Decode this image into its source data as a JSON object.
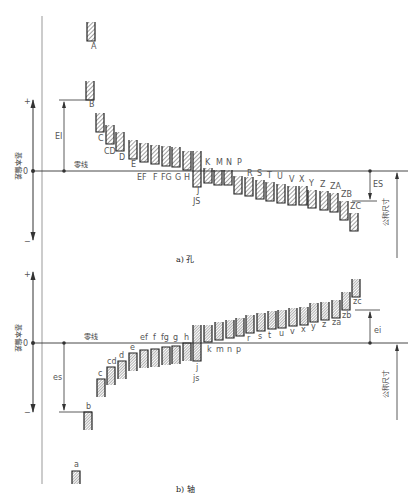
{
  "diagram": {
    "title_hole": "a) 孔",
    "title_shaft": "b) 轴",
    "axis_label": "基本偏差",
    "nominal_size_label": "公称尺寸",
    "zero_line_label": "零线",
    "zero_mark": "0",
    "plus_mark": "+",
    "minus_mark": "−",
    "hole_upper_label": "EI",
    "hole_lower_label": "ES",
    "shaft_upper_label": "es",
    "shaft_lower_label": "ei",
    "colors": {
      "line": "#333333",
      "hatch": "#444444",
      "text": "#555555"
    }
  },
  "hole": {
    "zero_y": 171,
    "boxes": [
      {
        "label": "A",
        "x": 87,
        "y1": 22,
        "y2": 41,
        "lx": 91,
        "ly": 49
      },
      {
        "label": "B",
        "x": 86,
        "y1": 81,
        "y2": 100,
        "lx": 89,
        "ly": 107
      },
      {
        "label": "C",
        "x": 96,
        "y1": 113,
        "y2": 132,
        "lx": 98,
        "ly": 141
      },
      {
        "label": "CD",
        "x": 106,
        "y1": 125,
        "y2": 144,
        "lx": 104,
        "ly": 154
      },
      {
        "label": "D",
        "x": 116,
        "y1": 132,
        "y2": 151,
        "lx": 119,
        "ly": 160
      },
      {
        "label": "E",
        "x": 129,
        "y1": 140,
        "y2": 159,
        "lx": 131,
        "ly": 167
      },
      {
        "label": "EF",
        "x": 140,
        "y1": 143,
        "y2": 162,
        "lx": 137,
        "ly": 180
      },
      {
        "label": "F",
        "x": 151,
        "y1": 145,
        "y2": 164,
        "lx": 153,
        "ly": 180
      },
      {
        "label": "FG",
        "x": 162,
        "y1": 146,
        "y2": 166,
        "lx": 161,
        "ly": 180
      },
      {
        "label": "G",
        "x": 172,
        "y1": 147,
        "y2": 167,
        "lx": 175,
        "ly": 180
      },
      {
        "label": "H",
        "x": 183,
        "y1": 151,
        "y2": 170,
        "lx": 184,
        "ly": 180
      },
      {
        "label": "J",
        "x": 193,
        "y1": 151,
        "y2": 187,
        "lx": 197,
        "ly": 193
      },
      {
        "label": "K",
        "x": 204,
        "y1": 168,
        "y2": 183,
        "lx": 205,
        "ly": 165
      },
      {
        "label": "M",
        "x": 214,
        "y1": 170,
        "y2": 185,
        "lx": 216,
        "ly": 165
      },
      {
        "label": "N",
        "x": 224,
        "y1": 170,
        "y2": 185,
        "lx": 226,
        "ly": 165
      },
      {
        "label": "P",
        "x": 234,
        "y1": 176,
        "y2": 194,
        "lx": 237,
        "ly": 165
      },
      {
        "label": "R",
        "x": 245,
        "y1": 177,
        "y2": 196,
        "lx": 247,
        "ly": 176
      },
      {
        "label": "S",
        "x": 256,
        "y1": 180,
        "y2": 199,
        "lx": 257,
        "ly": 176
      },
      {
        "label": "T",
        "x": 266,
        "y1": 182,
        "y2": 201,
        "lx": 267,
        "ly": 178
      },
      {
        "label": "U",
        "x": 277,
        "y1": 184,
        "y2": 203,
        "lx": 277,
        "ly": 179
      },
      {
        "label": "V",
        "x": 288,
        "y1": 186,
        "y2": 205,
        "lx": 289,
        "ly": 182
      },
      {
        "label": "X",
        "x": 299,
        "y1": 186,
        "y2": 205,
        "lx": 299,
        "ly": 182
      },
      {
        "label": "Y",
        "x": 308,
        "y1": 190,
        "y2": 208,
        "lx": 309,
        "ly": 186
      },
      {
        "label": "Z",
        "x": 320,
        "y1": 191,
        "y2": 210,
        "lx": 320,
        "ly": 187
      },
      {
        "label": "ZA",
        "x": 330,
        "y1": 193,
        "y2": 212,
        "lx": 330,
        "ly": 189
      },
      {
        "label": "ZB",
        "x": 340,
        "y1": 201,
        "y2": 220,
        "lx": 341,
        "ly": 197
      },
      {
        "label": "ZC",
        "x": 350,
        "y1": 213,
        "y2": 231,
        "lx": 350,
        "ly": 209
      }
    ],
    "js_label": "JS"
  },
  "shaft": {
    "zero_y": 343,
    "boxes": [
      {
        "label": "a",
        "x": 72,
        "y1": 471,
        "y2": 484,
        "lx": 74,
        "ly": 467
      },
      {
        "label": "b",
        "x": 84,
        "y1": 412,
        "y2": 430,
        "lx": 86,
        "ly": 409
      },
      {
        "label": "c",
        "x": 97,
        "y1": 379,
        "y2": 397,
        "lx": 98,
        "ly": 376
      },
      {
        "label": "cd",
        "x": 107,
        "y1": 367,
        "y2": 385,
        "lx": 107,
        "ly": 364
      },
      {
        "label": "d",
        "x": 118,
        "y1": 361,
        "y2": 379,
        "lx": 119,
        "ly": 358
      },
      {
        "label": "e",
        "x": 129,
        "y1": 353,
        "y2": 371,
        "lx": 130,
        "ly": 350
      },
      {
        "label": "ef",
        "x": 140,
        "y1": 350,
        "y2": 368,
        "lx": 140,
        "ly": 340
      },
      {
        "label": "f",
        "x": 151,
        "y1": 349,
        "y2": 367,
        "lx": 153,
        "ly": 340
      },
      {
        "label": "fg",
        "x": 162,
        "y1": 347,
        "y2": 365,
        "lx": 161,
        "ly": 340
      },
      {
        "label": "g",
        "x": 172,
        "y1": 346,
        "y2": 364,
        "lx": 173,
        "ly": 340
      },
      {
        "label": "h",
        "x": 183,
        "y1": 343,
        "y2": 361,
        "lx": 184,
        "ly": 340
      },
      {
        "label": "j",
        "x": 193,
        "y1": 325,
        "y2": 361,
        "lx": 196,
        "ly": 370
      },
      {
        "label": "k",
        "x": 204,
        "y1": 325,
        "y2": 342,
        "lx": 207,
        "ly": 352
      },
      {
        "label": "m",
        "x": 215,
        "y1": 322,
        "y2": 340,
        "lx": 216,
        "ly": 352
      },
      {
        "label": "n",
        "x": 226,
        "y1": 320,
        "y2": 338,
        "lx": 227,
        "ly": 352
      },
      {
        "label": "p",
        "x": 236,
        "y1": 318,
        "y2": 336,
        "lx": 236,
        "ly": 352
      },
      {
        "label": "r",
        "x": 246,
        "y1": 315,
        "y2": 333,
        "lx": 247,
        "ly": 341
      },
      {
        "label": "s",
        "x": 257,
        "y1": 313,
        "y2": 331,
        "lx": 258,
        "ly": 339
      },
      {
        "label": "t",
        "x": 268,
        "y1": 311,
        "y2": 329,
        "lx": 268,
        "ly": 338
      },
      {
        "label": "u",
        "x": 278,
        "y1": 310,
        "y2": 328,
        "lx": 279,
        "ly": 336
      },
      {
        "label": "v",
        "x": 289,
        "y1": 308,
        "y2": 326,
        "lx": 290,
        "ly": 334
      },
      {
        "label": "x",
        "x": 300,
        "y1": 307,
        "y2": 325,
        "lx": 301,
        "ly": 332
      },
      {
        "label": "y",
        "x": 310,
        "y1": 303,
        "y2": 322,
        "lx": 311,
        "ly": 329
      },
      {
        "label": "z",
        "x": 321,
        "y1": 302,
        "y2": 320,
        "lx": 322,
        "ly": 327
      },
      {
        "label": "za",
        "x": 332,
        "y1": 300,
        "y2": 318,
        "lx": 332,
        "ly": 325
      },
      {
        "label": "zb",
        "x": 342,
        "y1": 292,
        "y2": 310,
        "lx": 342,
        "ly": 318
      },
      {
        "label": "zc",
        "x": 352,
        "y1": 279,
        "y2": 297,
        "lx": 353,
        "ly": 304
      }
    ],
    "js_label": "js"
  }
}
